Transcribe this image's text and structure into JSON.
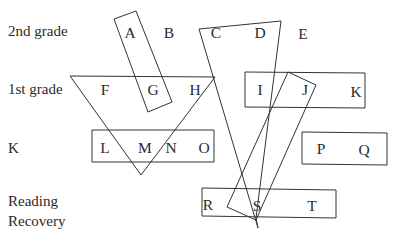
{
  "row_labels": {
    "grade2": "2nd grade",
    "grade1": "1st grade",
    "k": "K",
    "rr_line1": "Reading",
    "rr_line2": "Recovery"
  },
  "letters": {
    "A": "A",
    "B": "B",
    "C": "C",
    "D": "D",
    "E": "E",
    "F": "F",
    "G": "G",
    "H": "H",
    "I": "I",
    "J": "J",
    "K": "K",
    "L": "L",
    "M": "M",
    "N": "N",
    "O": "O",
    "P": "P",
    "Q": "Q",
    "R": "R",
    "S": "S",
    "T": "T"
  },
  "groupings": [
    {
      "name": "A-G rotated box",
      "members": [
        "A",
        "G"
      ]
    },
    {
      "name": "F-G-H-M-N triangle",
      "members": [
        "F",
        "G",
        "H",
        "M",
        "N"
      ]
    },
    {
      "name": "C-D-S quadrilateral",
      "members": [
        "C",
        "D",
        "S"
      ]
    },
    {
      "name": "I-J-K box",
      "members": [
        "I",
        "J",
        "K"
      ]
    },
    {
      "name": "J-S rotated box",
      "members": [
        "J",
        "S"
      ]
    },
    {
      "name": "L-M-N-O box",
      "members": [
        "L",
        "M",
        "N",
        "O"
      ]
    },
    {
      "name": "P-Q box",
      "members": [
        "P",
        "Q"
      ]
    },
    {
      "name": "R-S-T box",
      "members": [
        "R",
        "S",
        "T"
      ]
    }
  ]
}
